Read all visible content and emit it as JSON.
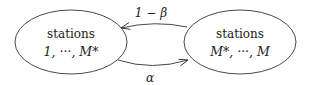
{
  "nodes": [
    {
      "id": "left",
      "title": "stations",
      "range": "1, ···, M*"
    },
    {
      "id": "right",
      "title": "stations",
      "range": "M*, ···, M"
    }
  ],
  "edges": [
    {
      "from": "right",
      "to": "left",
      "label": "1 − β"
    },
    {
      "from": "left",
      "to": "right",
      "label": "α"
    }
  ],
  "colors": {
    "stroke": "#333333",
    "text": "#222222",
    "background": "#ffffff"
  }
}
